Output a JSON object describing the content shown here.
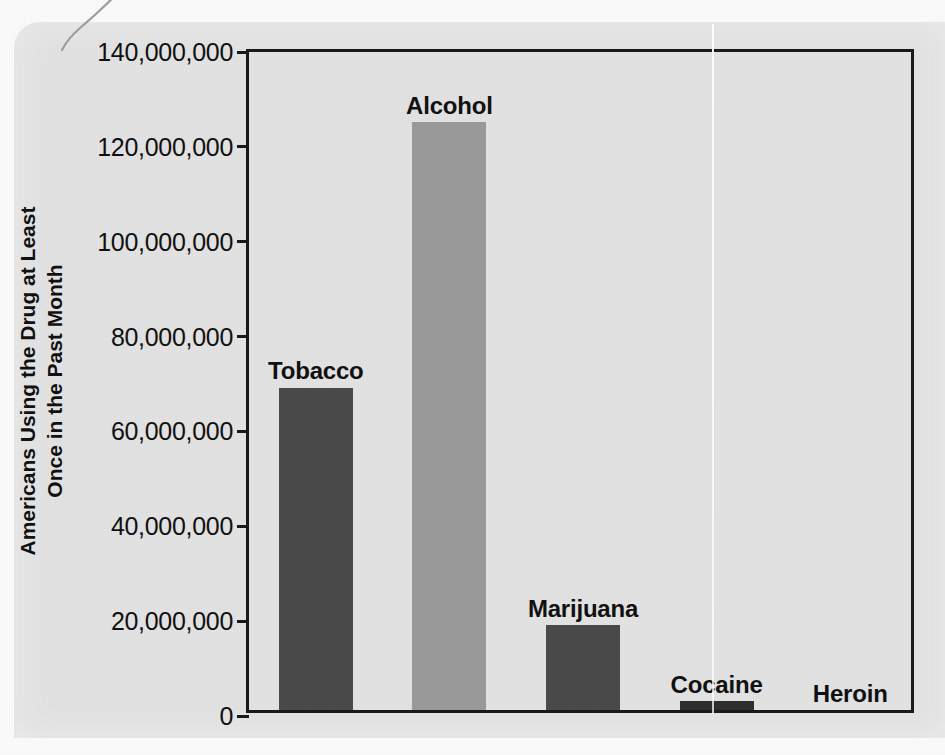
{
  "chart_data": {
    "type": "bar",
    "title": "",
    "subtitle": "",
    "xlabel": "",
    "ylabel": "Americans Using the Drug at Least Once in the Past Month",
    "ylabel_lines": [
      "Americans Using the Drug at Least",
      "Once in the Past Month"
    ],
    "categories": [
      "Tobacco",
      "Alcohol",
      "Marijuana",
      "Cocaine",
      "Heroin"
    ],
    "values": [
      68000000,
      124000000,
      18000000,
      2000000,
      0
    ],
    "bar_colors": [
      "#4a4a4a",
      "#9a9a9a",
      "#4a4a4a",
      "#2f2f2f",
      "#2f2f2f"
    ],
    "ylim": [
      0,
      140000000
    ],
    "ytick_values": [
      0,
      20000000,
      40000000,
      60000000,
      80000000,
      100000000,
      120000000,
      140000000
    ],
    "ytick_labels": [
      "0",
      "20,000,000",
      "40,000,000",
      "60,000,000",
      "80,000,000",
      "100,000,000",
      "120,000,000",
      "140,000,000"
    ],
    "grid": false,
    "legend": false,
    "legend_position": "none",
    "label_position": "above-bar",
    "plot_background": "#e3e3e3",
    "axis_color": "#1a1a1a"
  },
  "figure": {
    "paper_color": "#e3e3e3",
    "page_color": "#fbfbfb"
  }
}
